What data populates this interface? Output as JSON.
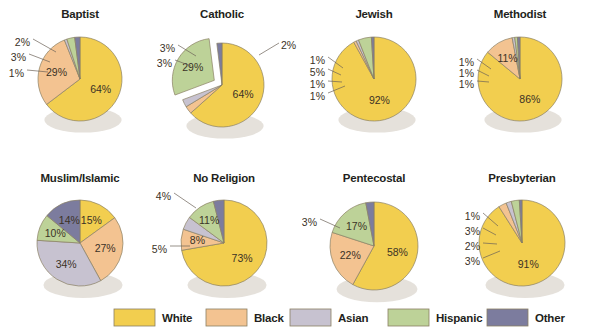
{
  "header": {
    "cropped_caption": ""
  },
  "legend": {
    "position": "bottom",
    "items": [
      {
        "label": "White",
        "color": "#F2CE4F"
      },
      {
        "label": "Black",
        "color": "#F3C391"
      },
      {
        "label": "Asian",
        "color": "#C7C2D0"
      },
      {
        "label": "Hispanic",
        "color": "#BDD298"
      },
      {
        "label": "Other",
        "color": "#7C7C9E"
      }
    ]
  },
  "chart_data": {
    "type": "pie",
    "title": "",
    "categories": [
      "White",
      "Black",
      "Asian",
      "Hispanic",
      "Other"
    ],
    "colors": [
      "#F2CE4F",
      "#F3C391",
      "#C7C2D0",
      "#BDD298",
      "#7C7C9E"
    ],
    "unit": "%",
    "charts": [
      {
        "title": "Baptist",
        "values": [
          64,
          29,
          1,
          3,
          2
        ],
        "labels": [
          "64%",
          "29%",
          "1%",
          "3%",
          "2%"
        ]
      },
      {
        "title": "Catholic",
        "values": [
          64,
          3,
          3,
          29,
          2
        ],
        "labels": [
          "64%",
          "3%",
          "3%",
          "29%",
          "2%"
        ],
        "exploded": "Hispanic"
      },
      {
        "title": "Jewish",
        "values": [
          92,
          1,
          1,
          5,
          1
        ],
        "labels": [
          "92%",
          "1%",
          "1%",
          "5%",
          "1%"
        ]
      },
      {
        "title": "Methodist",
        "values": [
          86,
          11,
          1,
          1,
          1
        ],
        "labels": [
          "86%",
          "11%",
          "1%",
          "1%",
          "1%"
        ]
      },
      {
        "title": "Muslim/Islamic",
        "values": [
          15,
          27,
          34,
          10,
          14
        ],
        "labels": [
          "15%",
          "27%",
          "34%",
          "10%",
          "14%"
        ]
      },
      {
        "title": "No Religion",
        "values": [
          73,
          8,
          5,
          11,
          4
        ],
        "labels": [
          "73%",
          "8%",
          "5%",
          "11%",
          "4%"
        ]
      },
      {
        "title": "Pentecostal",
        "values": [
          58,
          22,
          0,
          17,
          3
        ],
        "labels": [
          "58%",
          "22%",
          "",
          "17%",
          "3%"
        ]
      },
      {
        "title": "Presbyterian",
        "values": [
          91,
          3,
          2,
          3,
          1
        ],
        "labels": [
          "91%",
          "3%",
          "2%",
          "3%",
          "1%"
        ]
      }
    ]
  }
}
